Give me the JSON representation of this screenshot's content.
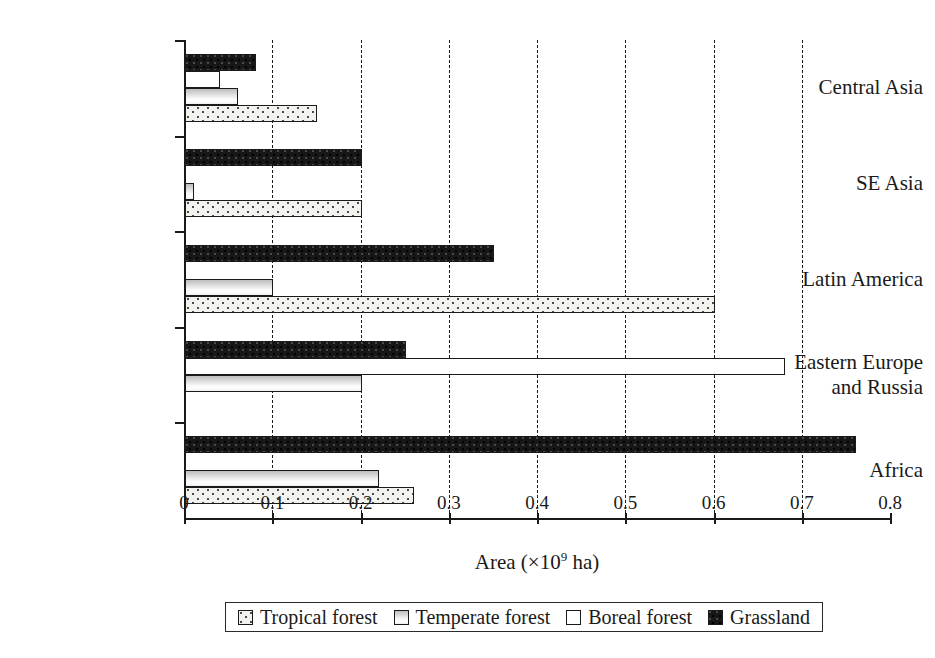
{
  "chart_data": {
    "type": "bar",
    "orientation": "horizontal",
    "title": "",
    "xlabel": "Area (×10⁹ ha)",
    "xlabel_parts": {
      "pre": "Area (×10",
      "sup": "9",
      "post": " ha)"
    },
    "ylabel": "",
    "xlim": [
      0,
      0.8
    ],
    "xticks": [
      0,
      0.1,
      0.2,
      0.3,
      0.4,
      0.5,
      0.6,
      0.7,
      0.8
    ],
    "xtick_labels": [
      "0",
      "0.1",
      "0.2",
      "0.3",
      "0.4",
      "0.5",
      "0.6",
      "0.7",
      "0.8"
    ],
    "grid": "vertical-dashed",
    "legend_position": "below-center",
    "categories": [
      "Central Asia",
      "SE Asia",
      "Latin America",
      "Eastern Europe\nand Russia",
      "Africa"
    ],
    "series": [
      {
        "name": "Tropical forest",
        "pattern": "dotted",
        "values": [
          0.15,
          0.2,
          0.6,
          0.0,
          0.26
        ]
      },
      {
        "name": "Temperate forest",
        "pattern": "gradient-gray",
        "values": [
          0.06,
          0.01,
          0.1,
          0.2,
          0.22
        ]
      },
      {
        "name": "Boreal forest",
        "pattern": "white",
        "values": [
          0.04,
          0.0,
          0.0,
          0.68,
          0.0
        ]
      },
      {
        "name": "Grassland",
        "pattern": "black",
        "values": [
          0.08,
          0.2,
          0.35,
          0.25,
          0.76
        ]
      }
    ]
  },
  "legend": {
    "items": [
      {
        "label": "Tropical forest"
      },
      {
        "label": "Temperate forest"
      },
      {
        "label": "Boreal forest"
      },
      {
        "label": "Grassland"
      }
    ]
  }
}
